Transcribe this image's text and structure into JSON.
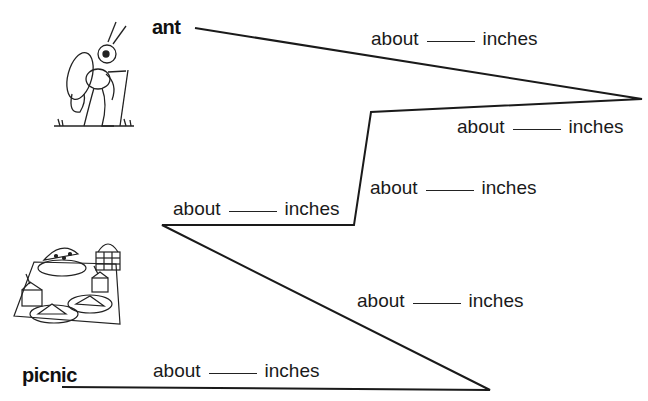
{
  "worksheet": {
    "start_label": "ant",
    "end_label": "picnic",
    "line_color": "#1a1a1a",
    "path_points": [
      [
        195,
        28
      ],
      [
        642,
        99
      ],
      [
        371,
        112
      ],
      [
        354,
        225
      ],
      [
        162,
        225
      ],
      [
        490,
        390
      ],
      [
        62,
        387
      ]
    ],
    "segments": [
      {
        "prefix": "about",
        "suffix": "inches",
        "answer": ""
      },
      {
        "prefix": "about",
        "suffix": "inches",
        "answer": ""
      },
      {
        "prefix": "about",
        "suffix": "inches",
        "answer": ""
      },
      {
        "prefix": "about",
        "suffix": "inches",
        "answer": ""
      },
      {
        "prefix": "about",
        "suffix": "inches",
        "answer": ""
      },
      {
        "prefix": "about",
        "suffix": "inches",
        "answer": ""
      }
    ]
  },
  "illustrations": {
    "top": "ant-hiker-icon",
    "bottom": "picnic-blanket-icon"
  }
}
